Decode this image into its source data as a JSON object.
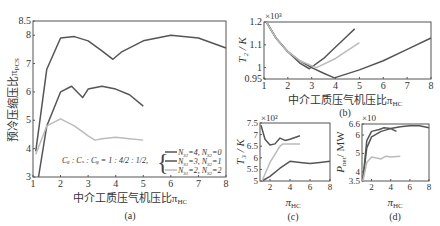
{
  "colors": {
    "series_dark": "#555555",
    "series_mid": "#666666",
    "series_light": "#bbbbbb",
    "axis": "#555555"
  },
  "chart_data": [
    {
      "panel": "(a)",
      "type": "line",
      "title": "",
      "xlabel": "中介工质压气机压比π_HC",
      "ylabel": "预冷压缩压比π_PCS",
      "xlim": [
        1,
        8
      ],
      "ylim": [
        3,
        8.5
      ],
      "xticks": [
        "1",
        "2",
        "3",
        "4",
        "5",
        "6",
        "7",
        "8"
      ],
      "yticks": [
        "3",
        "4",
        "5",
        "6",
        "7",
        "8",
        "8.5"
      ],
      "annotation": "C_a : C_s : C_f = 1 : 4/2 : 1/2,",
      "legend": [
        "N_S1 = 4, N_S2 = 0",
        "N_S1 = 3, N_S2 = 1",
        "N_S1 = 2, N_S2 = 2"
      ],
      "legend_position": "lower right",
      "series": [
        {
          "name": "N_S1=4, N_S2=0",
          "color": "#555555",
          "x": [
            1.1,
            1.5,
            2.0,
            2.5,
            3.0,
            3.5,
            3.9,
            4.2,
            5.0,
            6.0,
            7.0,
            8.0
          ],
          "y": [
            3.9,
            6.8,
            7.9,
            7.95,
            7.8,
            7.45,
            7.15,
            7.4,
            7.8,
            8.0,
            7.9,
            7.55
          ]
        },
        {
          "name": "N_S1=3, N_S2=1",
          "color": "#555555",
          "x": [
            1.2,
            1.5,
            2.0,
            2.4,
            2.8,
            3.0,
            3.5,
            4.0,
            4.5,
            5.0
          ],
          "y": [
            3.0,
            4.8,
            6.0,
            6.2,
            5.8,
            6.1,
            6.2,
            6.1,
            5.9,
            5.5
          ]
        },
        {
          "name": "N_S1=2, N_S2=2",
          "color": "#bbbbbb",
          "x": [
            1.1,
            1.5,
            2.0,
            2.5,
            3.0,
            3.25,
            3.5,
            4.0,
            4.5,
            5.0
          ],
          "y": [
            3.8,
            4.8,
            5.05,
            4.8,
            4.45,
            4.3,
            4.35,
            4.4,
            4.35,
            4.3
          ]
        }
      ]
    },
    {
      "panel": "(b)",
      "type": "line",
      "xlabel": "中介工质压气机压比π_HC",
      "ylabel": "T_2 / K",
      "multiplier": "×10³",
      "xlim": [
        1,
        8
      ],
      "ylim": [
        0.95,
        1.2
      ],
      "xticks": [
        "1",
        "2",
        "3",
        "4",
        "5",
        "6",
        "7",
        "8"
      ],
      "yticks": [
        "0.95",
        "1",
        "1.1",
        "1.2"
      ],
      "series": [
        {
          "name": "N_S1=4, N_S2=0",
          "color": "#555555",
          "x": [
            1.1,
            1.5,
            2.0,
            2.5,
            3.0,
            3.5,
            3.95,
            5.0,
            6.0,
            7.0,
            8.0
          ],
          "y": [
            1.2,
            1.13,
            1.07,
            1.03,
            1.0,
            0.975,
            0.955,
            0.99,
            1.03,
            1.08,
            1.13
          ]
        },
        {
          "name": "N_S1=3, N_S2=1",
          "color": "#555555",
          "x": [
            1.1,
            1.5,
            2.0,
            2.5,
            2.9,
            3.5,
            4.0,
            4.5,
            4.8
          ],
          "y": [
            1.2,
            1.13,
            1.07,
            1.02,
            0.995,
            1.04,
            1.09,
            1.14,
            1.17
          ]
        },
        {
          "name": "N_S1=2, N_S2=2",
          "color": "#bbbbbb",
          "x": [
            1.1,
            1.5,
            2.0,
            2.5,
            3.2,
            4.0,
            5.0
          ],
          "y": [
            1.2,
            1.13,
            1.07,
            1.03,
            1.0,
            1.04,
            1.11
          ]
        }
      ]
    },
    {
      "panel": "(c)",
      "type": "line",
      "xlabel": "π_HC",
      "ylabel": "T_3 / K",
      "multiplier": "×10²",
      "xlim": [
        1,
        8
      ],
      "ylim": [
        5,
        7.5
      ],
      "xticks": [
        "2",
        "4",
        "6",
        "8"
      ],
      "yticks": [
        "5",
        "5.5",
        "6",
        "6.5",
        "7",
        "7.5"
      ],
      "series": [
        {
          "name": "N_S1=4, N_S2=0",
          "color": "#555555",
          "x": [
            1.2,
            2.0,
            3.0,
            4.0,
            5.0,
            6.0,
            7.0,
            8.0
          ],
          "y": [
            5.0,
            5.2,
            5.55,
            5.85,
            5.8,
            5.75,
            5.8,
            5.85
          ]
        },
        {
          "name": "N_S1=3, N_S2=1",
          "color": "#555555",
          "x": [
            1.1,
            1.5,
            2.0,
            2.5,
            3.0,
            3.5,
            4.0,
            5.0
          ],
          "y": [
            7.4,
            6.8,
            6.55,
            6.6,
            6.85,
            6.75,
            6.8,
            6.95
          ]
        },
        {
          "name": "N_S1=2, N_S2=2",
          "color": "#bbbbbb",
          "x": [
            1.2,
            2.0,
            3.0,
            3.3,
            4.0,
            5.0
          ],
          "y": [
            5.0,
            5.8,
            6.5,
            6.6,
            6.6,
            6.6
          ]
        }
      ]
    },
    {
      "panel": "(d)",
      "type": "line",
      "xlabel": "π_HC",
      "ylabel": "P_net / MW",
      "multiplier": "×10",
      "xlim": [
        1,
        8
      ],
      "ylim": [
        3.5,
        6.6
      ],
      "xticks": [
        "2",
        "4",
        "6",
        "8"
      ],
      "yticks": [
        "3.5",
        "4",
        "5",
        "6",
        "6.6"
      ],
      "series": [
        {
          "name": "N_S1=4, N_S2=0",
          "color": "#555555",
          "x": [
            1.1,
            1.5,
            2.0,
            3.0,
            4.0,
            5.0,
            6.0,
            7.0,
            8.0
          ],
          "y": [
            3.6,
            5.3,
            5.9,
            6.2,
            6.35,
            6.45,
            6.5,
            6.5,
            6.4
          ]
        },
        {
          "name": "N_S1=3, N_S2=1",
          "color": "#555555",
          "x": [
            1.1,
            1.5,
            2.0,
            2.8,
            3.3,
            4.0,
            4.6
          ],
          "y": [
            3.6,
            5.7,
            6.2,
            6.3,
            6.4,
            6.35,
            6.2
          ]
        },
        {
          "name": "N_S1=2, N_S2=2",
          "color": "#bbbbbb",
          "x": [
            1.1,
            1.5,
            2.0,
            3.0,
            3.5,
            4.0,
            5.0
          ],
          "y": [
            3.5,
            4.5,
            4.8,
            4.7,
            4.85,
            4.8,
            4.85
          ]
        }
      ]
    }
  ],
  "captions": {
    "a": "(a)",
    "b": "(b)",
    "c": "(c)",
    "d": "(d)"
  },
  "panel_a": {
    "ylabel": "预冷压缩压比π",
    "ylabel_sub": "PCS",
    "xlabel": "中介工质压气机压比π",
    "xlabel_sub": "HC",
    "annotation": "Cₐ : Cₛ : Cᵩ = 1 : 4/2 : 1/2,",
    "legend": [
      {
        "label": "N",
        "sub1": "S1",
        "v1": "=4, N",
        "sub2": "S2",
        "v2": "=0"
      },
      {
        "label": "N",
        "sub1": "S1",
        "v1": "=3, N",
        "sub2": "S2",
        "v2": "=1"
      },
      {
        "label": "N",
        "sub1": "S1",
        "v1": "=2, N",
        "sub2": "S2",
        "v2": "=2"
      }
    ]
  },
  "panel_b": {
    "ylabel": "T₂ / K",
    "multiplier": "×10³",
    "xlabel": "中介工质压气机压比π",
    "xlabel_sub": "HC"
  },
  "panel_c": {
    "ylabel": "T₃ / K",
    "multiplier": "×10²",
    "xlabel": "π",
    "xlabel_sub": "HC"
  },
  "panel_d": {
    "ylabel": "P",
    "ylabel_sub": "net",
    "ylabel_unit": "/ MW",
    "multiplier": "×10",
    "xlabel": "π",
    "xlabel_sub": "HC"
  }
}
